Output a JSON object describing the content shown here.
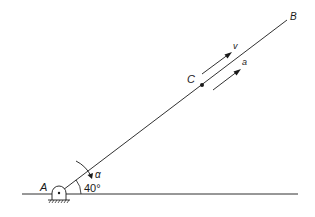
{
  "diagram": {
    "type": "mechanism-kinematics",
    "labels": {
      "pivot": "A",
      "rod_end": "B",
      "point": "C",
      "velocity": "v",
      "acceleration": "a",
      "angular": "α",
      "angle": "40°"
    },
    "angle_degrees": 40,
    "colors": {
      "ink": "#1a1a1a",
      "background": "#ffffff"
    }
  }
}
